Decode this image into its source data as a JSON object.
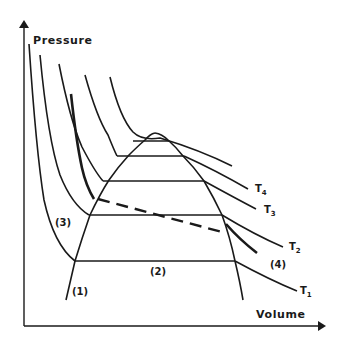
{
  "diagram": {
    "type": "pressure-volume isotherm diagram",
    "axes": {
      "y_label": "Pressure",
      "x_label": "Volume"
    },
    "isotherms": [
      {
        "label": "T",
        "subscript": "1"
      },
      {
        "label": "T",
        "subscript": "2"
      },
      {
        "label": "T",
        "subscript": "3"
      },
      {
        "label": "T",
        "subscript": "4"
      }
    ],
    "region_labels": {
      "r1": "(1)",
      "r2": "(2)",
      "r3": "(3)",
      "r4": "(4)"
    },
    "colors": {
      "ink": "#1a1a1a",
      "background": "#ffffff"
    }
  }
}
